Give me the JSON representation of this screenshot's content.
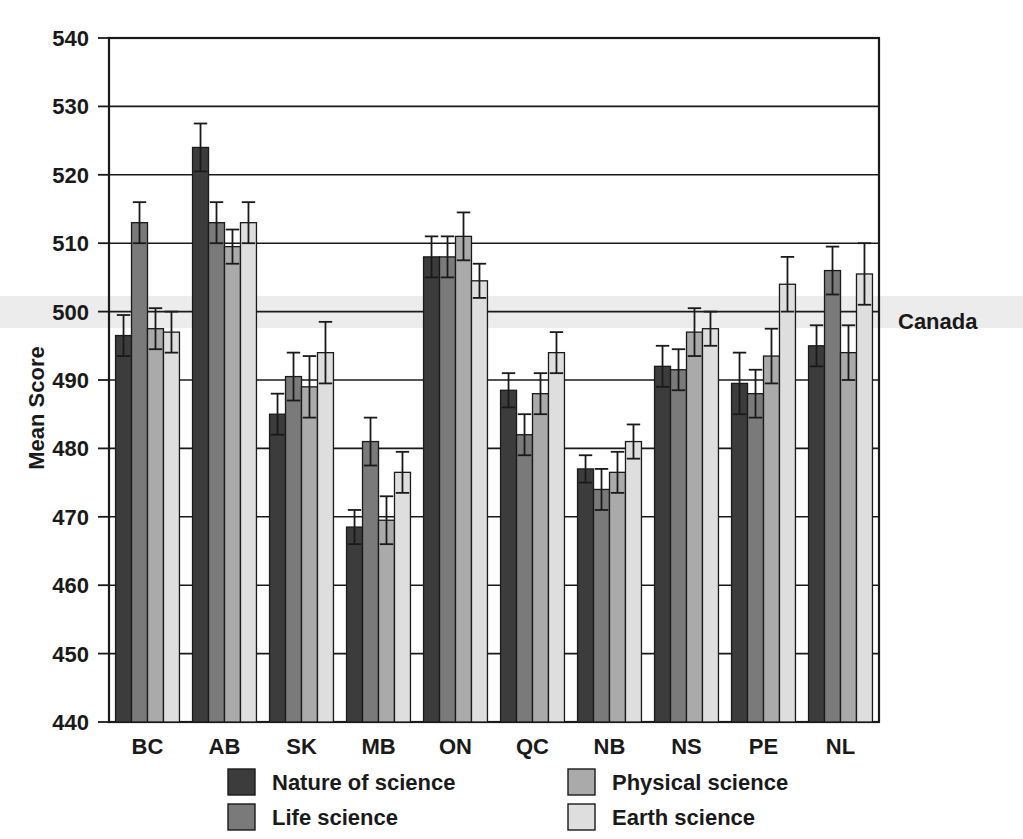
{
  "chart_data": {
    "type": "bar",
    "title": "",
    "subtitle": "",
    "xlabel": "",
    "ylabel": "Mean Score",
    "ylim": [
      440,
      540
    ],
    "ytick_step": 10,
    "yticks": [
      440,
      450,
      460,
      470,
      480,
      490,
      500,
      510,
      520,
      530,
      540
    ],
    "grid": true,
    "grid_axis": "y",
    "legend_position": "bottom",
    "reference_line": {
      "label": "Canada",
      "value": 500
    },
    "categories": [
      "BC",
      "AB",
      "SK",
      "MB",
      "ON",
      "QC",
      "NB",
      "NS",
      "PE",
      "NL"
    ],
    "series": [
      {
        "name": "Nature of science",
        "color": "#3c3c3c",
        "values": [
          496.5,
          524,
          485,
          468.5,
          508,
          488.5,
          477,
          492,
          489.5,
          495
        ],
        "errors": [
          3.0,
          3.5,
          3.0,
          2.5,
          3.0,
          2.5,
          2.0,
          3.0,
          4.5,
          3.0
        ]
      },
      {
        "name": "Life science",
        "color": "#7a7a7a",
        "values": [
          513,
          513,
          490.5,
          481,
          508,
          482,
          474,
          491.5,
          488,
          506
        ],
        "errors": [
          3.0,
          3.0,
          3.5,
          3.5,
          3.0,
          3.0,
          3.0,
          3.0,
          3.5,
          3.5
        ]
      },
      {
        "name": "Physical science",
        "color": "#aaaaaa",
        "values": [
          497.5,
          509.5,
          489,
          469.5,
          511,
          488,
          476.5,
          497,
          493.5,
          494
        ],
        "errors": [
          3.0,
          2.5,
          4.5,
          3.5,
          3.5,
          3.0,
          3.0,
          3.5,
          4.0,
          4.0
        ]
      },
      {
        "name": "Earth science",
        "color": "#dedede",
        "values": [
          497,
          513,
          494,
          476.5,
          504.5,
          494,
          481,
          497.5,
          504,
          505.5
        ],
        "errors": [
          3.0,
          3.0,
          4.5,
          3.0,
          2.5,
          3.0,
          2.5,
          2.5,
          4.0,
          4.5
        ]
      }
    ]
  },
  "legend": {
    "entries": [
      {
        "label": "Nature of science",
        "color": "#3c3c3c"
      },
      {
        "label": "Life science",
        "color": "#7a7a7a"
      },
      {
        "label": "Physical science",
        "color": "#aaaaaa"
      },
      {
        "label": "Earth science",
        "color": "#dedede"
      }
    ]
  },
  "axis": {
    "y_title": "Mean Score"
  },
  "annotations": {
    "canada": "Canada"
  },
  "colors": {
    "nature_of_science": "#3c3c3c",
    "life_science": "#7a7a7a",
    "physical_science": "#aaaaaa",
    "earth_science": "#dedede",
    "axis": "#1a1a1a",
    "band": "#ececec"
  }
}
